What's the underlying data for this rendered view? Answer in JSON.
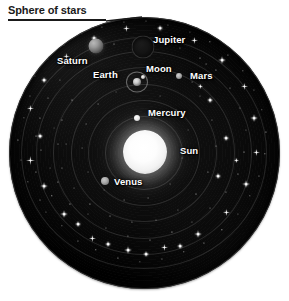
{
  "title": {
    "text": "Sphere of stars"
  },
  "colors": {
    "background": "#ffffff",
    "sphere_dark": "#0c0c0c",
    "star_white": "#ffffff",
    "label_text": "#ffffff",
    "title_text": "#1a1a1a",
    "orbit_ring": "rgba(190,190,190,0.17)"
  },
  "diagram": {
    "name": "geocentric-celestial-sphere",
    "center_x": 144,
    "center_y": 153,
    "radius": 135
  },
  "bodies": [
    {
      "id": "saturn",
      "label": "Saturn",
      "x": 96,
      "y": 46,
      "size": 15,
      "label_x": 57,
      "label_y": 55
    },
    {
      "id": "jupiter",
      "label": "Jupiter",
      "x": 143,
      "y": 47,
      "size": 23,
      "label_x": 153,
      "label_y": 34
    },
    {
      "id": "earth",
      "label": "Earth",
      "x": 137,
      "y": 82,
      "size": 8,
      "label_x": 93,
      "label_y": 69
    },
    {
      "id": "moon",
      "label": "Moon",
      "x": 143,
      "y": 77,
      "size": 4,
      "label_x": 146,
      "label_y": 63
    },
    {
      "id": "mars",
      "label": "Mars",
      "x": 179,
      "y": 76,
      "size": 6,
      "label_x": 190,
      "label_y": 70
    },
    {
      "id": "mercury",
      "label": "Mercury",
      "x": 137,
      "y": 118,
      "size": 6,
      "label_x": 148,
      "label_y": 107
    },
    {
      "id": "sun",
      "label": "Sun",
      "x": 145,
      "y": 152,
      "size": 44,
      "label_x": 180,
      "label_y": 145
    },
    {
      "id": "venus",
      "label": "Venus",
      "x": 105,
      "y": 181,
      "size": 8,
      "label_x": 114,
      "label_y": 176
    }
  ],
  "orbits": [
    {
      "id": "orbit-moon",
      "rx": 11,
      "ry": 10
    },
    {
      "id": "orbit-mercury",
      "rx": 38,
      "ry": 36
    },
    {
      "id": "orbit-venus",
      "rx": 55,
      "ry": 52
    },
    {
      "id": "orbit-sun",
      "rx": 72,
      "ry": 68
    },
    {
      "id": "orbit-mars",
      "rx": 90,
      "ry": 85
    },
    {
      "id": "orbit-jupiter",
      "rx": 107,
      "ry": 101
    },
    {
      "id": "orbit-saturn",
      "rx": 122,
      "ry": 115
    }
  ],
  "stars": {
    "dots": [
      [
        24,
        118,
        1.3
      ],
      [
        30,
        96,
        1.1
      ],
      [
        41,
        150,
        1.0
      ],
      [
        36,
        172,
        1.2
      ],
      [
        52,
        196,
        1.4
      ],
      [
        46,
        212,
        1.1
      ],
      [
        62,
        226,
        1.3
      ],
      [
        78,
        241,
        1.2
      ],
      [
        96,
        250,
        1.4
      ],
      [
        118,
        258,
        1.1
      ],
      [
        140,
        262,
        1.3
      ],
      [
        162,
        259,
        1.2
      ],
      [
        184,
        252,
        1.4
      ],
      [
        204,
        243,
        1.1
      ],
      [
        222,
        230,
        1.3
      ],
      [
        238,
        214,
        1.2
      ],
      [
        250,
        196,
        1.4
      ],
      [
        259,
        176,
        1.1
      ],
      [
        265,
        154,
        1.3
      ],
      [
        266,
        132,
        1.2
      ],
      [
        262,
        110,
        1.4
      ],
      [
        254,
        90,
        1.1
      ],
      [
        243,
        71,
        1.3
      ],
      [
        228,
        55,
        1.2
      ],
      [
        210,
        42,
        1.3
      ],
      [
        190,
        32,
        1.1
      ],
      [
        168,
        25,
        1.2
      ],
      [
        146,
        21,
        1.0
      ],
      [
        124,
        22,
        1.2
      ],
      [
        102,
        27,
        1.1
      ],
      [
        82,
        34,
        1.3
      ],
      [
        64,
        45,
        1.0
      ],
      [
        48,
        59,
        1.2
      ],
      [
        35,
        76,
        1.1
      ],
      [
        18,
        140,
        1.2
      ],
      [
        21,
        160,
        1.0
      ],
      [
        28,
        182,
        1.3
      ],
      [
        40,
        200,
        1.0
      ],
      [
        58,
        182,
        1.1
      ],
      [
        70,
        204,
        1.2
      ],
      [
        88,
        214,
        1.0
      ],
      [
        106,
        228,
        1.1
      ],
      [
        128,
        236,
        1.2
      ],
      [
        150,
        240,
        1.0
      ],
      [
        172,
        232,
        1.1
      ],
      [
        192,
        222,
        1.2
      ],
      [
        210,
        208,
        1.0
      ],
      [
        226,
        192,
        1.1
      ],
      [
        238,
        174,
        1.2
      ],
      [
        244,
        152,
        1.0
      ],
      [
        246,
        130,
        1.1
      ],
      [
        240,
        108,
        1.2
      ],
      [
        230,
        88,
        1.0
      ],
      [
        216,
        70,
        1.1
      ],
      [
        200,
        58,
        1.0
      ],
      [
        180,
        48,
        1.1
      ],
      [
        158,
        42,
        1.0
      ],
      [
        136,
        40,
        1.1
      ],
      [
        114,
        44,
        1.0
      ],
      [
        94,
        52,
        1.1
      ],
      [
        76,
        64,
        1.0
      ],
      [
        60,
        80,
        1.1
      ],
      [
        48,
        98,
        1.0
      ],
      [
        40,
        118,
        1.1
      ],
      [
        36,
        136,
        1.0
      ],
      [
        200,
        96,
        1.0
      ],
      [
        212,
        120,
        1.1
      ],
      [
        216,
        146,
        1.0
      ],
      [
        208,
        172,
        1.1
      ],
      [
        196,
        194,
        1.0
      ],
      [
        178,
        210,
        1.1
      ],
      [
        156,
        220,
        1.0
      ],
      [
        132,
        222,
        1.1
      ],
      [
        110,
        216,
        1.0
      ],
      [
        90,
        204,
        1.1
      ],
      [
        74,
        188,
        1.0
      ],
      [
        62,
        168,
        1.1
      ],
      [
        58,
        144,
        1.0
      ],
      [
        62,
        120,
        1.1
      ],
      [
        72,
        100,
        1.0
      ],
      [
        188,
        130,
        0.9
      ],
      [
        182,
        158,
        0.9
      ],
      [
        170,
        184,
        0.9
      ],
      [
        148,
        198,
        0.9
      ],
      [
        124,
        200,
        0.9
      ],
      [
        104,
        190,
        0.9
      ],
      [
        88,
        172,
        0.9
      ],
      [
        82,
        148,
        0.9
      ],
      [
        86,
        124,
        0.9
      ],
      [
        98,
        104,
        0.9
      ],
      [
        116,
        92,
        0.9
      ],
      [
        160,
        96,
        0.9
      ],
      [
        176,
        110,
        0.9
      ],
      [
        192,
        82,
        0.9
      ],
      [
        206,
        64,
        0.9
      ],
      [
        54,
        128,
        0.9
      ],
      [
        50,
        168,
        0.9
      ],
      [
        66,
        144,
        0.9
      ]
    ],
    "sparkles": [
      [
        30,
        160,
        9
      ],
      [
        44,
        186,
        8
      ],
      [
        64,
        214,
        8
      ],
      [
        92,
        238,
        7
      ],
      [
        128,
        250,
        8
      ],
      [
        164,
        247,
        7
      ],
      [
        198,
        234,
        8
      ],
      [
        226,
        212,
        7
      ],
      [
        246,
        184,
        8
      ],
      [
        256,
        152,
        7
      ],
      [
        254,
        118,
        8
      ],
      [
        244,
        86,
        7
      ],
      [
        222,
        60,
        8
      ],
      [
        194,
        40,
        7
      ],
      [
        160,
        28,
        6
      ],
      [
        126,
        28,
        7
      ],
      [
        94,
        38,
        6
      ],
      [
        66,
        56,
        7
      ],
      [
        44,
        80,
        6
      ],
      [
        30,
        108,
        7
      ],
      [
        210,
        100,
        6
      ],
      [
        226,
        138,
        6
      ],
      [
        218,
        176,
        6
      ],
      [
        200,
        86,
        5
      ],
      [
        78,
        224,
        6
      ],
      [
        108,
        244,
        6
      ],
      [
        146,
        254,
        6
      ],
      [
        180,
        246,
        6
      ],
      [
        236,
        160,
        5
      ],
      [
        40,
        136,
        6
      ]
    ]
  }
}
